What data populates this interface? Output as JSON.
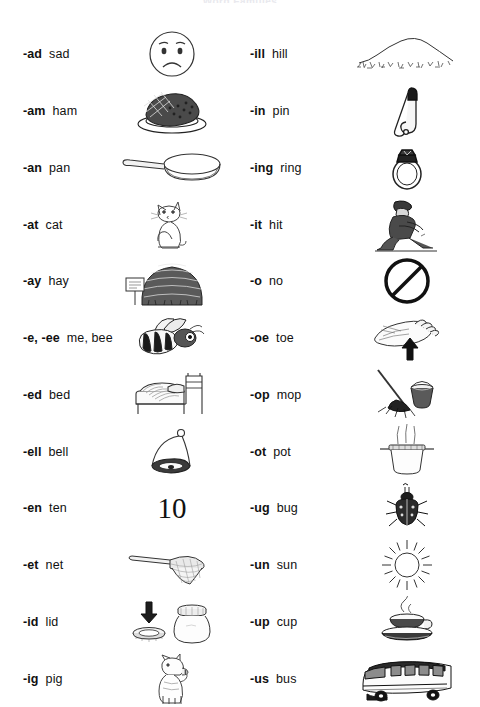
{
  "title": "Word Families",
  "sheet": {
    "background": "#ffffff",
    "ink": "#111111"
  },
  "columns": [
    {
      "name": "left-column",
      "rows": [
        {
          "rime": "-ad",
          "word": "sad",
          "icon": "sad-face-icon"
        },
        {
          "rime": "-am",
          "word": "ham",
          "icon": "ham-on-plate-icon"
        },
        {
          "rime": "-an",
          "word": "pan",
          "icon": "frying-pan-icon"
        },
        {
          "rime": "-at",
          "word": "cat",
          "icon": "sitting-cat-icon"
        },
        {
          "rime": "-ay",
          "word": "hay",
          "icon": "haystack-icon"
        },
        {
          "rime": "-e, -ee",
          "word": "me, bee",
          "icon": "bee-icon"
        },
        {
          "rime": "-ed",
          "word": "bed",
          "icon": "bed-icon"
        },
        {
          "rime": "-ell",
          "word": "bell",
          "icon": "bell-icon"
        },
        {
          "rime": "-en",
          "word": "ten",
          "icon": "number-ten-icon",
          "text": "10"
        },
        {
          "rime": "-et",
          "word": "net",
          "icon": "butterfly-net-icon"
        },
        {
          "rime": "-id",
          "word": "lid",
          "icon": "lid-and-jar-icon"
        },
        {
          "rime": "-ig",
          "word": "pig",
          "icon": "pig-icon"
        }
      ]
    },
    {
      "name": "right-column",
      "rows": [
        {
          "rime": "-ill",
          "word": "hill",
          "icon": "hill-icon"
        },
        {
          "rime": "-in",
          "word": "pin",
          "icon": "safety-pin-icon"
        },
        {
          "rime": "-ing",
          "word": "ring",
          "icon": "ring-icon"
        },
        {
          "rime": "-it",
          "word": "hit",
          "icon": "person-hitting-icon"
        },
        {
          "rime": "-o",
          "word": "no",
          "icon": "prohibition-sign-icon"
        },
        {
          "rime": "-oe",
          "word": "toe",
          "icon": "foot-toe-arrow-icon"
        },
        {
          "rime": "-op",
          "word": "mop",
          "icon": "mop-and-bucket-icon"
        },
        {
          "rime": "-ot",
          "word": "pot",
          "icon": "steaming-pot-icon"
        },
        {
          "rime": "-ug",
          "word": "bug",
          "icon": "beetle-icon"
        },
        {
          "rime": "-un",
          "word": "sun",
          "icon": "sun-icon"
        },
        {
          "rime": "-up",
          "word": "cup",
          "icon": "coffee-cup-icon"
        },
        {
          "rime": "-us",
          "word": "bus",
          "icon": "bus-icon"
        }
      ]
    }
  ]
}
